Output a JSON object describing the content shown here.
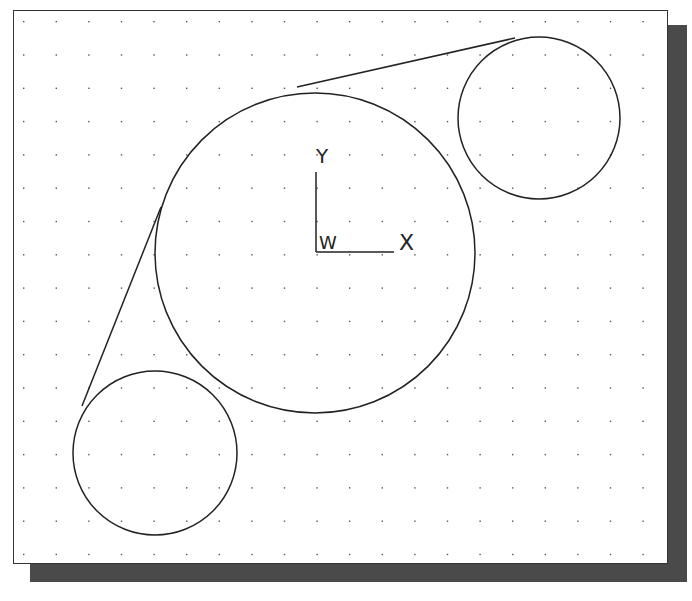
{
  "drawing": {
    "grid": {
      "spacing_x": 32.6,
      "spacing_y": 33.3,
      "origin_x": 23,
      "origin_y": 21,
      "dot_color": "#555555"
    },
    "ucs_icon": {
      "y_label": "Y",
      "x_label": "X",
      "w_label": "W"
    },
    "circles": [
      {
        "name": "large-circle",
        "cx": 315,
        "cy": 253,
        "r": 160
      },
      {
        "name": "top-right-circle",
        "cx": 539,
        "cy": 118,
        "r": 81
      },
      {
        "name": "bottom-left-circle",
        "cx": 155,
        "cy": 453,
        "r": 82
      }
    ],
    "tangent_lines": [
      {
        "name": "top-tangent-line",
        "x1": 297,
        "y1": 87,
        "x2": 515,
        "y2": 38
      },
      {
        "name": "left-tangent-line",
        "x1": 161,
        "y1": 207,
        "x2": 82,
        "y2": 406
      }
    ],
    "line_color": "#222222"
  }
}
